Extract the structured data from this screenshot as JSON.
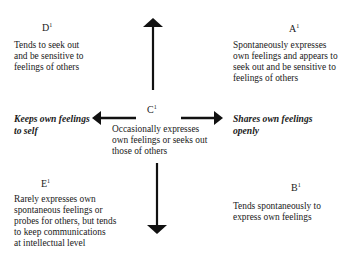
{
  "diagram": {
    "quadrants": {
      "D": {
        "label": "D",
        "mark": "1",
        "text": "Tends to seek out\nand be sensitive to\nfeelings of others"
      },
      "A": {
        "label": "A",
        "mark": "1",
        "text": "Spontaneously expresses\nown feelings and appears to\nseek out and be sensitive to\nfeelings of others"
      },
      "C": {
        "label": "C",
        "mark": "1",
        "text": "Occasionally expresses\nown feelings or seeks out\nthose of others"
      },
      "E": {
        "label": "E",
        "mark": "1",
        "text": "Rarely expresses own\nspontaneous feelings or\nprobes for others, but tends\nto keep communications\nat intellectual level"
      },
      "B": {
        "label": "B",
        "mark": "1",
        "text": "Tends spontaneously to\nexpress own feelings"
      }
    },
    "axes": {
      "left": "Keeps own feelings\nto self",
      "right": "Shares own feelings\nopenly"
    },
    "arrows": [
      "up",
      "down",
      "left",
      "right"
    ],
    "colors": {
      "text": "#1a1a1a",
      "arrow": "#111111",
      "background": "#ffffff"
    }
  }
}
